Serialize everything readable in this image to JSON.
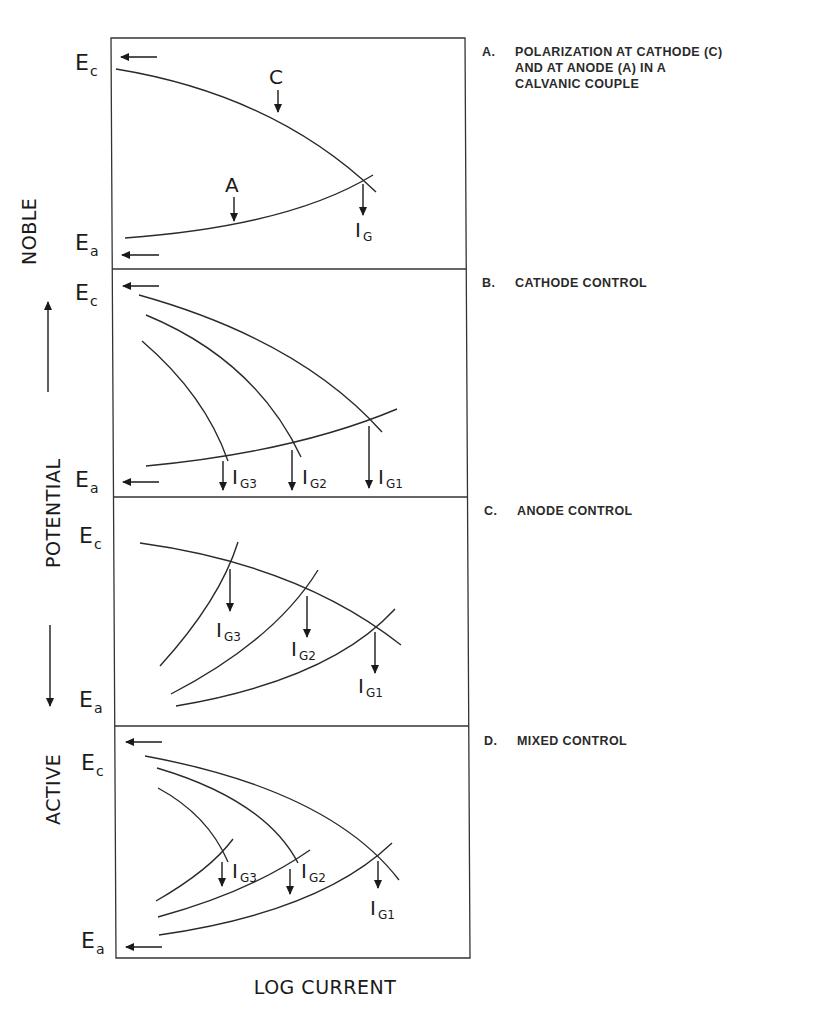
{
  "figure": {
    "y_axis": {
      "noble_label": "NOBLE",
      "potential_label": "POTENTIAL",
      "active_label": "ACTIVE",
      "ec_main": "E",
      "ec_sub": "c",
      "ea_main": "E",
      "ea_sub": "a"
    },
    "x_axis": {
      "label": "LOG CURRENT"
    },
    "panels": [
      {
        "id": "A",
        "letter": "A.",
        "caption_lines": [
          "POLARIZATION AT CATHODE (C)",
          "AND AT ANODE (A) IN A",
          "CALVANIC COUPLE"
        ],
        "curve_labels": {
          "cathode": "C",
          "anode": "A"
        },
        "current_labels": [
          {
            "main": "I",
            "sub": "G"
          }
        ]
      },
      {
        "id": "B",
        "letter": "B.",
        "caption_lines": [
          "CATHODE CONTROL"
        ],
        "current_labels": [
          {
            "main": "I",
            "sub": "G3"
          },
          {
            "main": "I",
            "sub": "G2"
          },
          {
            "main": "I",
            "sub": "G1"
          }
        ]
      },
      {
        "id": "C",
        "letter": "C.",
        "caption_lines": [
          "ANODE CONTROL"
        ],
        "current_labels": [
          {
            "main": "I",
            "sub": "G3"
          },
          {
            "main": "I",
            "sub": "G2"
          },
          {
            "main": "I",
            "sub": "G1"
          }
        ]
      },
      {
        "id": "D",
        "letter": "D.",
        "caption_lines": [
          "MIXED CONTROL"
        ],
        "current_labels": [
          {
            "main": "I",
            "sub": "G3"
          },
          {
            "main": "I",
            "sub": "G2"
          },
          {
            "main": "I",
            "sub": "G1"
          }
        ]
      }
    ]
  }
}
